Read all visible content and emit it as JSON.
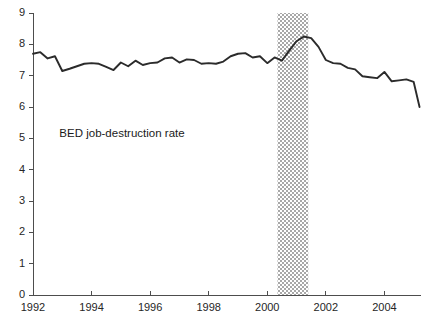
{
  "chart_data": {
    "type": "line",
    "title": "",
    "subtitle": "",
    "xlabel": "",
    "ylabel": "",
    "xlim": [
      1992.0,
      2005.25
    ],
    "ylim": [
      0,
      9
    ],
    "grid": false,
    "legend_position": "inline-annotation",
    "y_ticks": [
      "0",
      "1",
      "2",
      "3",
      "4",
      "5",
      "6",
      "7",
      "8",
      "9"
    ],
    "y_tick_values": [
      0,
      1,
      2,
      3,
      4,
      5,
      6,
      7,
      8,
      9
    ],
    "x_ticks": [
      "1992",
      "1994",
      "1996",
      "1998",
      "2000",
      "2002",
      "2004"
    ],
    "x_tick_values": [
      1992,
      1994,
      1996,
      1998,
      2000,
      2002,
      2004
    ],
    "annotations": [
      {
        "name": "series-label",
        "text": "BED job-destruction rate",
        "x": 1992.9,
        "y": 5.05
      }
    ],
    "shaded_bands": [
      {
        "name": "recession-band",
        "label": "",
        "x_start": 2000.35,
        "x_end": 2001.4,
        "y_start": 0,
        "y_end": 9,
        "fill": "#9e9e9e",
        "pattern": "dotted-hatch"
      }
    ],
    "series": [
      {
        "name": "BED job-destruction rate",
        "color": "#2b2b2b",
        "x": [
          1992.0,
          1992.25,
          1992.5,
          1992.75,
          1993.0,
          1993.25,
          1993.5,
          1993.75,
          1994.0,
          1994.25,
          1994.5,
          1994.75,
          1995.0,
          1995.25,
          1995.5,
          1995.75,
          1996.0,
          1996.25,
          1996.5,
          1996.75,
          1997.0,
          1997.25,
          1997.5,
          1997.75,
          1998.0,
          1998.25,
          1998.5,
          1998.75,
          1999.0,
          1999.25,
          1999.5,
          1999.75,
          2000.0,
          2000.25,
          2000.5,
          2000.75,
          2001.0,
          2001.25,
          2001.5,
          2001.75,
          2002.0,
          2002.25,
          2002.5,
          2002.75,
          2003.0,
          2003.25,
          2003.5,
          2003.75,
          2004.0,
          2004.25,
          2004.5,
          2004.75,
          2005.0,
          2005.2
        ],
        "y": [
          7.7,
          7.75,
          7.55,
          7.62,
          7.15,
          7.22,
          7.3,
          7.38,
          7.4,
          7.38,
          7.28,
          7.18,
          7.42,
          7.3,
          7.48,
          7.34,
          7.4,
          7.42,
          7.55,
          7.58,
          7.42,
          7.52,
          7.5,
          7.38,
          7.4,
          7.38,
          7.45,
          7.62,
          7.7,
          7.72,
          7.58,
          7.62,
          7.4,
          7.58,
          7.48,
          7.8,
          8.1,
          8.25,
          8.2,
          7.92,
          7.5,
          7.4,
          7.38,
          7.25,
          7.2,
          6.98,
          6.95,
          6.92,
          7.12,
          6.82,
          6.85,
          6.88,
          6.8,
          6.0
        ]
      }
    ]
  },
  "figure": {
    "caption": ""
  }
}
